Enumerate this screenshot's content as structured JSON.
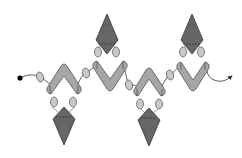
{
  "diagram": {
    "colors": {
      "background": "#ffffff",
      "chevron_fill": "#a6a6a6",
      "chevron_stroke": "#555555",
      "diamond_fill": "#666666",
      "diamond_stroke": "#333333",
      "seed_fill": "#c8c8c8",
      "seed_stroke": "#555555",
      "thread": "#333333",
      "start_dot": "#000000"
    },
    "thread": {
      "start_marker": "dot",
      "end_marker": "arrow"
    },
    "units": [
      {
        "chevron": "up",
        "diamond": "down"
      },
      {
        "chevron": "down",
        "diamond": "up"
      },
      {
        "chevron": "up",
        "diamond": "down"
      },
      {
        "chevron": "down",
        "diamond": "up"
      }
    ]
  }
}
